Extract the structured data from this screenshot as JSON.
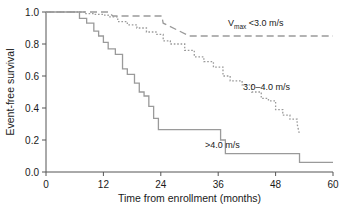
{
  "chart_data": {
    "type": "line",
    "title": "",
    "xlabel": "Time from enrollment (months)",
    "ylabel": "Event-free survival",
    "xlim": [
      0,
      60
    ],
    "ylim": [
      0.0,
      1.0
    ],
    "grid": false,
    "legend_position": "inline-annotations",
    "xticks": [
      0,
      12,
      24,
      36,
      48,
      60
    ],
    "xtick_labels": [
      "0",
      "12",
      "24",
      "36",
      "48",
      "60"
    ],
    "yticks": [
      0.0,
      0.2,
      0.4,
      0.6,
      0.8,
      1.0
    ],
    "ytick_labels": [
      "0.0",
      "0.2",
      "0.4",
      "0.6",
      "0.8",
      "1.0"
    ],
    "line_color": "#9a9a9a",
    "series": [
      {
        "name": "Vmax <3.0 m/s",
        "label_main": "V",
        "label_sub": "max",
        "label_rest": " <3.0 m/s",
        "style": "dashed",
        "label_x": 228,
        "label_y": 26,
        "x": [
          0,
          13,
          14,
          24.2,
          24.5,
          30,
          60
        ],
        "y": [
          1.0,
          1.0,
          0.975,
          0.975,
          0.93,
          0.85,
          0.85
        ]
      },
      {
        "name": "3.0-4.0 m/s",
        "label_text": "3.0–4.0 m/s",
        "style": "dotted",
        "label_x": 243,
        "label_y": 90,
        "x": [
          0,
          8,
          8,
          10,
          10,
          12,
          12,
          13,
          13,
          15,
          15,
          17,
          17,
          19,
          19,
          21,
          21,
          23,
          23,
          24.5,
          24.5,
          26,
          26,
          29,
          29,
          31,
          31,
          33,
          33,
          35,
          35,
          37,
          37,
          38.5,
          38.5,
          41,
          41,
          43,
          43,
          45,
          45,
          46.5,
          46.5,
          48,
          48,
          49.5,
          49.5,
          51,
          51,
          52.5,
          52.5,
          53
        ],
        "y": [
          1.0,
          1.0,
          0.99,
          0.99,
          0.985,
          0.985,
          0.98,
          0.98,
          0.97,
          0.97,
          0.94,
          0.94,
          0.92,
          0.92,
          0.9,
          0.9,
          0.875,
          0.875,
          0.86,
          0.86,
          0.82,
          0.82,
          0.8,
          0.8,
          0.76,
          0.76,
          0.72,
          0.72,
          0.69,
          0.69,
          0.655,
          0.655,
          0.6,
          0.6,
          0.57,
          0.57,
          0.545,
          0.545,
          0.5,
          0.5,
          0.46,
          0.46,
          0.445,
          0.445,
          0.39,
          0.39,
          0.355,
          0.355,
          0.33,
          0.33,
          0.3,
          0.235
        ]
      },
      {
        "name": ">4.0 m/s",
        "label_text": ">4.0 m/s",
        "style": "solid",
        "label_x": 205,
        "label_y": 148,
        "x": [
          0,
          7,
          7,
          8.5,
          8.5,
          10,
          10,
          11,
          11,
          12,
          12,
          13,
          13,
          14.5,
          14.5,
          16,
          16,
          17,
          17,
          18.5,
          18.5,
          19.5,
          19.5,
          20.5,
          20.5,
          21.5,
          21.5,
          22.5,
          22.5,
          23.5,
          23.5,
          36.5,
          36.5,
          37.5,
          37.5,
          53,
          53,
          60
        ],
        "y": [
          1.0,
          1.0,
          0.96,
          0.96,
          0.93,
          0.93,
          0.88,
          0.88,
          0.85,
          0.85,
          0.81,
          0.81,
          0.77,
          0.77,
          0.735,
          0.735,
          0.645,
          0.645,
          0.61,
          0.61,
          0.555,
          0.555,
          0.5,
          0.5,
          0.475,
          0.475,
          0.41,
          0.41,
          0.335,
          0.335,
          0.265,
          0.265,
          0.2,
          0.2,
          0.115,
          0.115,
          0.06,
          0.06
        ]
      }
    ]
  }
}
